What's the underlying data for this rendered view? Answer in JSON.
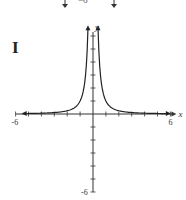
{
  "panel_label": "I",
  "top_fragment": "−6",
  "chart_data": {
    "type": "line",
    "title": "",
    "function": "y = 1/x^2",
    "xlabel": "x",
    "ylabel": "y",
    "xlim": [
      -6,
      6
    ],
    "ylim": [
      -6,
      6
    ],
    "x_tick_labels": [
      "-6",
      "6"
    ],
    "y_tick_labels": [
      "-6"
    ],
    "grid": false,
    "series": [
      {
        "name": "left branch",
        "x": [
          -5.5,
          -4,
          -3,
          -2,
          -1.5,
          -1,
          -0.7,
          -0.5,
          -0.41
        ],
        "y": [
          0.03,
          0.06,
          0.11,
          0.25,
          0.44,
          1,
          2.04,
          4,
          6
        ]
      },
      {
        "name": "right branch",
        "x": [
          0.41,
          0.5,
          0.7,
          1,
          1.5,
          2,
          3,
          4,
          5.5
        ],
        "y": [
          6,
          4,
          2.04,
          1,
          0.44,
          0.25,
          0.11,
          0.06,
          0.03
        ]
      }
    ]
  }
}
